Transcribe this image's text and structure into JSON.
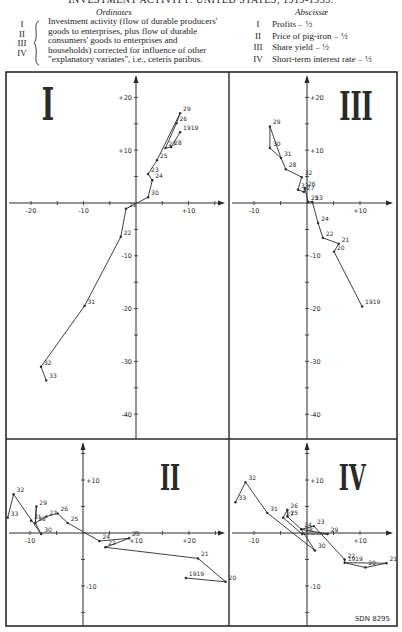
{
  "header": {
    "title": "INVESTMENT ACTIVITY: UNITED STATES, 1919-1933.",
    "ordinates_heading": "Ordinates",
    "abscissae_heading": "Abscissæ",
    "ordinate_numerals": [
      "I",
      "II",
      "III",
      "IV"
    ],
    "ordinate_text": "Investment activity (flow of durable producers' goods to enterprises, plus flow of durable consumers' goods to enterprises and households) corrected for influence of other \"explanatory variates\", i.e., ceteris paribus.",
    "abscissae": [
      {
        "num": "I",
        "label": "Profits ₋ ½"
      },
      {
        "num": "II",
        "label": "Price of pig-iron ₋ ½"
      },
      {
        "num": "III",
        "label": "Share yield ₋ ½"
      },
      {
        "num": "IV",
        "label": "Short-term interest rate ₋ ½"
      }
    ],
    "footer_code": "SDN 8295"
  },
  "colors": {
    "ink": "#2a2a2a",
    "paper": "#ffffff"
  },
  "chart_data": [
    {
      "type": "line",
      "panel": "I",
      "title": "I",
      "xlabel": "Profits (lag 1/2)",
      "ylabel": "Investment activity",
      "x_ticks": [
        -20,
        -10,
        10
      ],
      "y_ticks": [
        20,
        10,
        -10,
        -20,
        -30,
        -40
      ],
      "xlim": [
        -25,
        20
      ],
      "ylim": [
        -45,
        23
      ],
      "points": [
        {
          "label": "1919",
          "x": 8.4,
          "y": 13.4
        },
        {
          "label": "21",
          "x": -1.9,
          "y": -1.1
        },
        {
          "label": "22",
          "x": -2.9,
          "y": -6.4
        },
        {
          "label": "23",
          "x": 2.3,
          "y": 5.5
        },
        {
          "label": "24",
          "x": 3.1,
          "y": 4.3
        },
        {
          "label": "25",
          "x": 4.0,
          "y": 8.1
        },
        {
          "label": "26",
          "x": 7.7,
          "y": 15.1
        },
        {
          "label": "27",
          "x": 5.6,
          "y": 10.4
        },
        {
          "label": "28",
          "x": 6.7,
          "y": 10.6
        },
        {
          "label": "29",
          "x": 8.4,
          "y": 17.0
        },
        {
          "label": "30",
          "x": 2.3,
          "y": 1.1
        },
        {
          "label": "31",
          "x": -9.8,
          "y": -19.5
        },
        {
          "label": "32",
          "x": -18.1,
          "y": -31.0
        },
        {
          "label": "33",
          "x": -17.1,
          "y": -33.6
        }
      ],
      "path_order": [
        "1919",
        "28",
        "27",
        "26",
        "29",
        "25",
        "23",
        "24",
        "30",
        "21",
        "22",
        "31",
        "32",
        "33"
      ]
    },
    {
      "type": "line",
      "panel": "III",
      "title": "III",
      "xlabel": "Share yield (lag 1/2)",
      "ylabel": "Investment activity",
      "x_ticks": [
        -10,
        10
      ],
      "y_ticks": [
        20,
        10,
        -10,
        -20,
        -30,
        -40
      ],
      "xlim": [
        -15,
        17
      ],
      "ylim": [
        -45,
        23
      ],
      "points": [
        {
          "label": "1919",
          "x": 10.4,
          "y": -19.6
        },
        {
          "label": "20",
          "x": 5.1,
          "y": -9.2
        },
        {
          "label": "21",
          "x": 6.0,
          "y": -7.7
        },
        {
          "label": "22",
          "x": 3.0,
          "y": -6.6
        },
        {
          "label": "23",
          "x": 1.0,
          "y": 0.2
        },
        {
          "label": "24",
          "x": 2.1,
          "y": -3.8
        },
        {
          "label": "25",
          "x": 0.2,
          "y": 0.2
        },
        {
          "label": "26",
          "x": -0.4,
          "y": 2.8
        },
        {
          "label": "27",
          "x": -0.6,
          "y": 2.1
        },
        {
          "label": "28",
          "x": -4.0,
          "y": 6.4
        },
        {
          "label": "29",
          "x": -7.0,
          "y": 14.5
        },
        {
          "label": "30",
          "x": -7.0,
          "y": 10.4
        },
        {
          "label": "31",
          "x": -4.9,
          "y": 8.5
        },
        {
          "label": "32",
          "x": -1.0,
          "y": 4.9
        },
        {
          "label": "33",
          "x": -1.7,
          "y": 2.5
        }
      ],
      "path_order": [
        "1919",
        "20",
        "21",
        "22",
        "24",
        "23",
        "25",
        "26",
        "27",
        "33",
        "32",
        "28",
        "31",
        "29",
        "30",
        "31"
      ]
    },
    {
      "type": "line",
      "panel": "II",
      "title": "II",
      "xlabel": "Price of pig-iron (lag 1/2)",
      "ylabel": "Investment activity",
      "x_ticks": [
        -10,
        10,
        20
      ],
      "y_ticks": [
        10,
        -10
      ],
      "xlim": [
        -15,
        27
      ],
      "ylim": [
        -17,
        19
      ],
      "points": [
        {
          "label": "1919",
          "x": 19.4,
          "y": -8.5
        },
        {
          "label": "20",
          "x": 26.9,
          "y": -9.2
        },
        {
          "label": "21",
          "x": 21.7,
          "y": -4.8
        },
        {
          "label": "22",
          "x": 4.2,
          "y": -2.7
        },
        {
          "label": "23",
          "x": 8.7,
          "y": -1.0
        },
        {
          "label": "24",
          "x": 3.1,
          "y": -1.5
        },
        {
          "label": "25",
          "x": -2.9,
          "y": 1.9
        },
        {
          "label": "26",
          "x": -4.8,
          "y": 3.7
        },
        {
          "label": "27",
          "x": -6.9,
          "y": 3.1
        },
        {
          "label": "28",
          "x": -9.0,
          "y": 1.9
        },
        {
          "label": "29",
          "x": -8.8,
          "y": 5.0
        },
        {
          "label": "30",
          "x": -7.9,
          "y": -0.2
        },
        {
          "label": "31",
          "x": -9.8,
          "y": 2.3
        },
        {
          "label": "32",
          "x": -13.1,
          "y": 7.3
        },
        {
          "label": "33",
          "x": -14.2,
          "y": 2.9
        }
      ],
      "path_order": [
        "1919",
        "20",
        "21",
        "22",
        "23",
        "24",
        "25",
        "26",
        "27",
        "28",
        "29",
        "28",
        "30",
        "32",
        "33"
      ]
    },
    {
      "type": "line",
      "panel": "IV",
      "title": "IV",
      "xlabel": "Short-term interest rate (lag 1/2)",
      "ylabel": "Investment activity",
      "x_ticks": [
        -10,
        10
      ],
      "y_ticks": [
        10,
        -10
      ],
      "xlim": [
        -15,
        17
      ],
      "ylim": [
        -17,
        19
      ],
      "points": [
        {
          "label": "1919",
          "x": 7.1,
          "y": -5.6
        },
        {
          "label": "20",
          "x": 11.0,
          "y": -6.5
        },
        {
          "label": "21",
          "x": 15.0,
          "y": -5.7
        },
        {
          "label": "22",
          "x": 7.1,
          "y": -5.0
        },
        {
          "label": "23",
          "x": 1.3,
          "y": 1.3
        },
        {
          "label": "24",
          "x": -1.1,
          "y": 0.7
        },
        {
          "label": "25",
          "x": -3.7,
          "y": 3.1
        },
        {
          "label": "26",
          "x": -3.7,
          "y": 4.4
        },
        {
          "label": "27",
          "x": -4.5,
          "y": 2.9
        },
        {
          "label": "28",
          "x": -0.9,
          "y": -0.2
        },
        {
          "label": "29",
          "x": 3.9,
          "y": -0.2
        },
        {
          "label": "30",
          "x": 1.5,
          "y": -3.3
        },
        {
          "label": "31",
          "x": -7.5,
          "y": 3.8
        },
        {
          "label": "32",
          "x": -11.6,
          "y": 9.6
        },
        {
          "label": "33",
          "x": -13.5,
          "y": 5.8
        }
      ],
      "path_order": [
        "1919",
        "21",
        "20",
        "1919",
        "22",
        "23",
        "24",
        "25",
        "26",
        "27",
        "28",
        "29",
        "24",
        "30",
        "31",
        "32",
        "33"
      ]
    }
  ]
}
